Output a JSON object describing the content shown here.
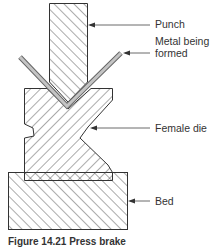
{
  "figure": {
    "labels": {
      "punch": "Punch",
      "metal_line1": "Metal being",
      "metal_line2": "formed",
      "female_die": "Female die",
      "bed": "Bed"
    },
    "caption": "Figure 14.21 Press brake",
    "colors": {
      "outline": "#333333",
      "hatch": "#444444",
      "metal_fill": "#bdbdbd",
      "background": "#ffffff"
    }
  }
}
